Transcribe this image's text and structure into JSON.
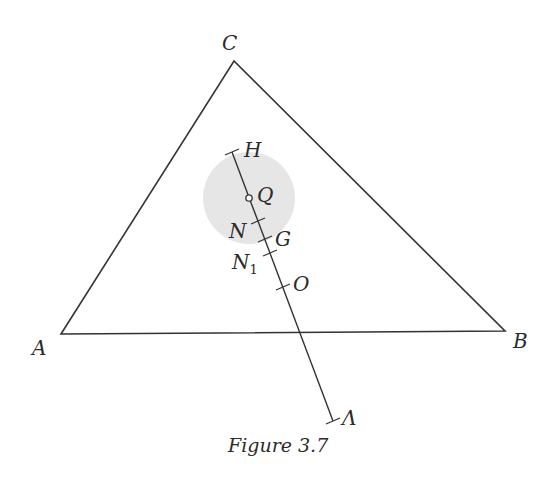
{
  "figure": {
    "caption": "Figure 3.7",
    "colors": {
      "stroke": "#333333",
      "disc_fill": "#e6e6e6",
      "background": "#ffffff"
    },
    "triangle": {
      "vertices": {
        "A": {
          "label": "A",
          "x": 61,
          "y": 334
        },
        "B": {
          "label": "B",
          "x": 505,
          "y": 331
        },
        "C": {
          "label": "C",
          "x": 234,
          "y": 61
        }
      }
    },
    "disc": {
      "center_label": "Q",
      "cx": 249,
      "cy": 198,
      "r": 46
    },
    "euler_line": {
      "start": {
        "x": 232,
        "y": 152
      },
      "end": {
        "x": 333,
        "y": 421
      },
      "points": [
        {
          "label": "H",
          "x": 232,
          "y": 152,
          "marker": "tick"
        },
        {
          "label": "Q",
          "x": 249,
          "y": 198,
          "marker": "open-circle"
        },
        {
          "label": "N",
          "x": 258,
          "y": 221,
          "marker": "tick"
        },
        {
          "label": "G",
          "x": 265,
          "y": 239,
          "marker": "tick"
        },
        {
          "label": "N",
          "subscript": "1",
          "x": 270,
          "y": 253,
          "marker": "tick"
        },
        {
          "label": "O",
          "x": 283,
          "y": 287,
          "marker": "tick"
        },
        {
          "label": "Λ",
          "x": 333,
          "y": 421,
          "marker": "tick"
        }
      ]
    }
  }
}
